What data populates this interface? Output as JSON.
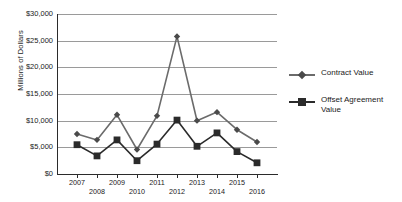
{
  "chart_data": {
    "type": "line",
    "title": "",
    "xlabel": "",
    "ylabel": "Millions of Dollars",
    "categories": [
      "2007",
      "2008",
      "2009",
      "2010",
      "2011",
      "2012",
      "2013",
      "2014",
      "2015",
      "2016"
    ],
    "x_tick_labels_top": [
      "2007",
      "2009",
      "2011",
      "2013",
      "2015"
    ],
    "x_tick_labels_bottom": [
      "2008",
      "2010",
      "2012",
      "2014",
      "2016"
    ],
    "y_tick_labels": [
      "$30,000",
      "$25,000",
      "$20,000",
      "$15,000",
      "$10,000",
      "$5,000",
      "$0"
    ],
    "y_tick_values": [
      30000,
      25000,
      20000,
      15000,
      10000,
      5000,
      0
    ],
    "ylim": [
      0,
      30000
    ],
    "grid": true,
    "legend_position": "right",
    "series": [
      {
        "name": "Contract Value",
        "marker": "diamond",
        "color": "#6b6b6b",
        "values": [
          7500,
          6400,
          11100,
          4600,
          10900,
          25800,
          10000,
          11600,
          8300,
          6000
        ]
      },
      {
        "name": "Offset Agreement Value",
        "marker": "square",
        "color": "#2b2b2b",
        "values": [
          5500,
          3400,
          6400,
          2500,
          5600,
          10100,
          5200,
          7700,
          4200,
          2100
        ]
      }
    ]
  },
  "legend": {
    "entries": [
      {
        "label": "Contract Value"
      },
      {
        "label": "Offset Agreement Value"
      }
    ]
  },
  "colors": {
    "contract": "#6b6b6b",
    "offset": "#2b2b2b",
    "grid": "#9a9a9a",
    "axis": "#2b2b2b",
    "background": "#ffffff"
  }
}
